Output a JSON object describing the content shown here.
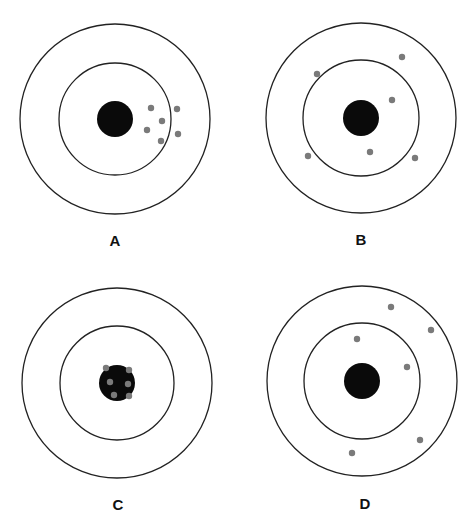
{
  "figure": {
    "colors": {
      "ring": "#222222",
      "bullseye": "#0a0a0a",
      "shot": "#7a7a7a",
      "background": "#ffffff"
    },
    "targets": [
      {
        "label": "A",
        "center": [
          115,
          119
        ],
        "outer_r": 95,
        "inner_r": 56,
        "bull_r": 18,
        "label_pos": [
          115,
          246
        ],
        "shots": [
          [
            151,
            108
          ],
          [
            177,
            109
          ],
          [
            162,
            121
          ],
          [
            147,
            130
          ],
          [
            178,
            134
          ],
          [
            161,
            141
          ]
        ]
      },
      {
        "label": "B",
        "center": [
          361,
          118
        ],
        "outer_r": 95,
        "inner_r": 58,
        "bull_r": 18,
        "label_pos": [
          361,
          245
        ],
        "shots": [
          [
            402,
            57
          ],
          [
            317,
            74
          ],
          [
            392,
            100
          ],
          [
            308,
            156
          ],
          [
            370,
            152
          ],
          [
            415,
            158
          ]
        ]
      },
      {
        "label": "C",
        "center": [
          117,
          383
        ],
        "outer_r": 95,
        "inner_r": 57,
        "bull_r": 18,
        "label_pos": [
          118,
          510
        ],
        "shots": [
          [
            106,
            368
          ],
          [
            129,
            370
          ],
          [
            110,
            382
          ],
          [
            128,
            384
          ],
          [
            114,
            395
          ],
          [
            129,
            396
          ]
        ]
      },
      {
        "label": "D",
        "center": [
          362,
          381
        ],
        "outer_r": 95,
        "inner_r": 58,
        "bull_r": 18,
        "label_pos": [
          365,
          509
        ],
        "shots": [
          [
            391,
            307
          ],
          [
            431,
            330
          ],
          [
            357,
            339
          ],
          [
            407,
            367
          ],
          [
            420,
            440
          ],
          [
            352,
            453
          ]
        ]
      }
    ]
  }
}
